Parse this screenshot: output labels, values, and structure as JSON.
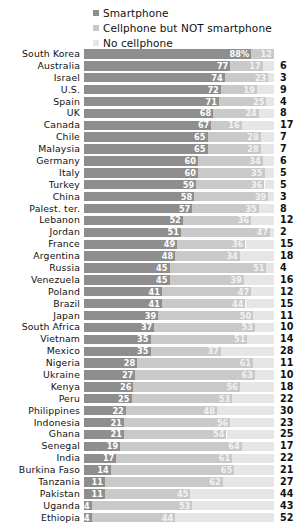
{
  "legend": {
    "items": [
      {
        "label": "Smartphone",
        "color": "#8e8e8e",
        "key": "smartphone"
      },
      {
        "label": "Cellphone but NOT smartphone",
        "color": "#c9c9c9",
        "key": "cellphone"
      },
      {
        "label": "No cellphone",
        "color": "#e6e6e6",
        "key": "none"
      }
    ]
  },
  "chart_data": {
    "type": "bar",
    "subtype": "stacked-horizontal-100",
    "title": "",
    "subtitle": "",
    "xlabel": "",
    "ylabel": "",
    "xlim": [
      0,
      100
    ],
    "grid": false,
    "legend_position": "top",
    "value_unit": "%",
    "first_value_suffix": "%",
    "categories": [
      "South Korea",
      "Australia",
      "Israel",
      "U.S.",
      "Spain",
      "UK",
      "Canada",
      "Chile",
      "Malaysia",
      "Germany",
      "Italy",
      "Turkey",
      "China",
      "Palest. ter.",
      "Lebanon",
      "Jordan",
      "France",
      "Argentina",
      "Russia",
      "Venezuela",
      "Poland",
      "Brazil",
      "Japan",
      "South Africa",
      "Vietnam",
      "Mexico",
      "Nigeria",
      "Ukraine",
      "Kenya",
      "Peru",
      "Philippines",
      "Indonesia",
      "Ghana",
      "Senegal",
      "India",
      "Burkina Faso",
      "Tanzania",
      "Pakistan",
      "Uganda",
      "Ethiopia"
    ],
    "series": [
      {
        "name": "Smartphone",
        "color": "#8e8e8e",
        "values": [
          88,
          77,
          74,
          72,
          71,
          68,
          67,
          65,
          65,
          60,
          60,
          59,
          58,
          57,
          52,
          51,
          49,
          48,
          45,
          45,
          41,
          41,
          39,
          37,
          35,
          35,
          28,
          27,
          26,
          25,
          22,
          21,
          21,
          19,
          17,
          14,
          11,
          11,
          4,
          4
        ]
      },
      {
        "name": "Cellphone but NOT smartphone",
        "color": "#c9c9c9",
        "values": [
          12,
          17,
          23,
          19,
          25,
          24,
          16,
          28,
          28,
          34,
          35,
          36,
          39,
          35,
          36,
          47,
          36,
          34,
          51,
          39,
          47,
          44,
          50,
          53,
          51,
          37,
          61,
          63,
          56,
          53,
          48,
          56,
          54,
          64,
          61,
          65,
          62,
          45,
          53,
          44
        ]
      },
      {
        "name": "No cellphone",
        "color": "#e6e6e6",
        "values": [
          0,
          6,
          3,
          9,
          4,
          8,
          17,
          7,
          7,
          6,
          5,
          5,
          3,
          8,
          12,
          2,
          15,
          18,
          4,
          16,
          12,
          15,
          11,
          10,
          14,
          28,
          11,
          10,
          18,
          22,
          30,
          23,
          25,
          17,
          22,
          21,
          27,
          44,
          43,
          52
        ]
      }
    ]
  },
  "rows": [
    {
      "country": "South Korea",
      "smartphone": 88,
      "smartphone_label": "88%",
      "cellphone": 12,
      "cellphone_label": "12",
      "none": 0,
      "none_label": ""
    },
    {
      "country": "Australia",
      "smartphone": 77,
      "smartphone_label": "77",
      "cellphone": 17,
      "cellphone_label": "17",
      "none": 6,
      "none_label": "6"
    },
    {
      "country": "Israel",
      "smartphone": 74,
      "smartphone_label": "74",
      "cellphone": 23,
      "cellphone_label": "23",
      "none": 3,
      "none_label": "3"
    },
    {
      "country": "U.S.",
      "smartphone": 72,
      "smartphone_label": "72",
      "cellphone": 19,
      "cellphone_label": "19",
      "none": 9,
      "none_label": "9"
    },
    {
      "country": "Spain",
      "smartphone": 71,
      "smartphone_label": "71",
      "cellphone": 25,
      "cellphone_label": "25",
      "none": 4,
      "none_label": "4"
    },
    {
      "country": "UK",
      "smartphone": 68,
      "smartphone_label": "68",
      "cellphone": 24,
      "cellphone_label": "24",
      "none": 8,
      "none_label": "8"
    },
    {
      "country": "Canada",
      "smartphone": 67,
      "smartphone_label": "67",
      "cellphone": 16,
      "cellphone_label": "16",
      "none": 17,
      "none_label": "17"
    },
    {
      "country": "Chile",
      "smartphone": 65,
      "smartphone_label": "65",
      "cellphone": 28,
      "cellphone_label": "28",
      "none": 7,
      "none_label": "7"
    },
    {
      "country": "Malaysia",
      "smartphone": 65,
      "smartphone_label": "65",
      "cellphone": 28,
      "cellphone_label": "28",
      "none": 7,
      "none_label": "7"
    },
    {
      "country": "Germany",
      "smartphone": 60,
      "smartphone_label": "60",
      "cellphone": 34,
      "cellphone_label": "34",
      "none": 6,
      "none_label": "6"
    },
    {
      "country": "Italy",
      "smartphone": 60,
      "smartphone_label": "60",
      "cellphone": 35,
      "cellphone_label": "35",
      "none": 5,
      "none_label": "5"
    },
    {
      "country": "Turkey",
      "smartphone": 59,
      "smartphone_label": "59",
      "cellphone": 36,
      "cellphone_label": "36",
      "none": 5,
      "none_label": "5"
    },
    {
      "country": "China",
      "smartphone": 58,
      "smartphone_label": "58",
      "cellphone": 39,
      "cellphone_label": "39",
      "none": 3,
      "none_label": "3"
    },
    {
      "country": "Palest. ter.",
      "smartphone": 57,
      "smartphone_label": "57",
      "cellphone": 35,
      "cellphone_label": "35",
      "none": 8,
      "none_label": "8"
    },
    {
      "country": "Lebanon",
      "smartphone": 52,
      "smartphone_label": "52",
      "cellphone": 36,
      "cellphone_label": "36",
      "none": 12,
      "none_label": "12"
    },
    {
      "country": "Jordan",
      "smartphone": 51,
      "smartphone_label": "51",
      "cellphone": 47,
      "cellphone_label": "47",
      "none": 2,
      "none_label": "2"
    },
    {
      "country": "France",
      "smartphone": 49,
      "smartphone_label": "49",
      "cellphone": 36,
      "cellphone_label": "36",
      "none": 15,
      "none_label": "15"
    },
    {
      "country": "Argentina",
      "smartphone": 48,
      "smartphone_label": "48",
      "cellphone": 34,
      "cellphone_label": "34",
      "none": 18,
      "none_label": "18"
    },
    {
      "country": "Russia",
      "smartphone": 45,
      "smartphone_label": "45",
      "cellphone": 51,
      "cellphone_label": "51",
      "none": 4,
      "none_label": "4"
    },
    {
      "country": "Venezuela",
      "smartphone": 45,
      "smartphone_label": "45",
      "cellphone": 39,
      "cellphone_label": "39",
      "none": 16,
      "none_label": "16"
    },
    {
      "country": "Poland",
      "smartphone": 41,
      "smartphone_label": "41",
      "cellphone": 47,
      "cellphone_label": "47",
      "none": 12,
      "none_label": "12"
    },
    {
      "country": "Brazil",
      "smartphone": 41,
      "smartphone_label": "41",
      "cellphone": 44,
      "cellphone_label": "44",
      "none": 15,
      "none_label": "15"
    },
    {
      "country": "Japan",
      "smartphone": 39,
      "smartphone_label": "39",
      "cellphone": 50,
      "cellphone_label": "50",
      "none": 11,
      "none_label": "11"
    },
    {
      "country": "South Africa",
      "smartphone": 37,
      "smartphone_label": "37",
      "cellphone": 53,
      "cellphone_label": "53",
      "none": 10,
      "none_label": "10"
    },
    {
      "country": "Vietnam",
      "smartphone": 35,
      "smartphone_label": "35",
      "cellphone": 51,
      "cellphone_label": "51",
      "none": 14,
      "none_label": "14"
    },
    {
      "country": "Mexico",
      "smartphone": 35,
      "smartphone_label": "35",
      "cellphone": 37,
      "cellphone_label": "37",
      "none": 28,
      "none_label": "28"
    },
    {
      "country": "Nigeria",
      "smartphone": 28,
      "smartphone_label": "28",
      "cellphone": 61,
      "cellphone_label": "61",
      "none": 11,
      "none_label": "11"
    },
    {
      "country": "Ukraine",
      "smartphone": 27,
      "smartphone_label": "27",
      "cellphone": 63,
      "cellphone_label": "63",
      "none": 10,
      "none_label": "10"
    },
    {
      "country": "Kenya",
      "smartphone": 26,
      "smartphone_label": "26",
      "cellphone": 56,
      "cellphone_label": "56",
      "none": 18,
      "none_label": "18"
    },
    {
      "country": "Peru",
      "smartphone": 25,
      "smartphone_label": "25",
      "cellphone": 53,
      "cellphone_label": "53",
      "none": 22,
      "none_label": "22"
    },
    {
      "country": "Philippines",
      "smartphone": 22,
      "smartphone_label": "22",
      "cellphone": 48,
      "cellphone_label": "48",
      "none": 30,
      "none_label": "30"
    },
    {
      "country": "Indonesia",
      "smartphone": 21,
      "smartphone_label": "21",
      "cellphone": 56,
      "cellphone_label": "56",
      "none": 23,
      "none_label": "23"
    },
    {
      "country": "Ghana",
      "smartphone": 21,
      "smartphone_label": "21",
      "cellphone": 54,
      "cellphone_label": "54",
      "none": 25,
      "none_label": "25"
    },
    {
      "country": "Senegal",
      "smartphone": 19,
      "smartphone_label": "19",
      "cellphone": 64,
      "cellphone_label": "64",
      "none": 17,
      "none_label": "17"
    },
    {
      "country": "India",
      "smartphone": 17,
      "smartphone_label": "17",
      "cellphone": 61,
      "cellphone_label": "61",
      "none": 22,
      "none_label": "22"
    },
    {
      "country": "Burkina Faso",
      "smartphone": 14,
      "smartphone_label": "14",
      "cellphone": 65,
      "cellphone_label": "65",
      "none": 21,
      "none_label": "21"
    },
    {
      "country": "Tanzania",
      "smartphone": 11,
      "smartphone_label": "11",
      "cellphone": 62,
      "cellphone_label": "62",
      "none": 27,
      "none_label": "27"
    },
    {
      "country": "Pakistan",
      "smartphone": 11,
      "smartphone_label": "11",
      "cellphone": 45,
      "cellphone_label": "45",
      "none": 44,
      "none_label": "44"
    },
    {
      "country": "Uganda",
      "smartphone": 4,
      "smartphone_label": "4",
      "cellphone": 53,
      "cellphone_label": "53",
      "none": 43,
      "none_label": "43"
    },
    {
      "country": "Ethiopia",
      "smartphone": 4,
      "smartphone_label": "4",
      "cellphone": 44,
      "cellphone_label": "44",
      "none": 52,
      "none_label": "52"
    }
  ]
}
